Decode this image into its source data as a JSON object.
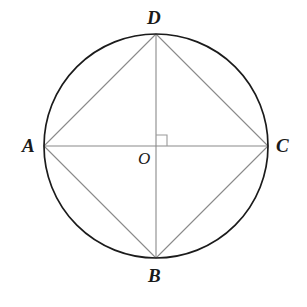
{
  "figure": {
    "background_color": "#ffffff",
    "circle": {
      "name": "circumscribed-circle",
      "center_x": 156,
      "center_y": 146,
      "radius": 112,
      "stroke_color": "#1b1b1b",
      "stroke_width": 1.7
    },
    "center_point": {
      "name": "center-O",
      "label": "O",
      "x": 156,
      "y": 146
    },
    "points": [
      {
        "key": "A",
        "label": "A",
        "x": 44,
        "y": 146,
        "position": "left"
      },
      {
        "key": "B",
        "label": "B",
        "x": 156,
        "y": 258,
        "position": "bottom"
      },
      {
        "key": "C",
        "label": "C",
        "x": 268,
        "y": 146,
        "position": "right"
      },
      {
        "key": "D",
        "label": "D",
        "x": 156,
        "y": 34,
        "position": "top"
      }
    ],
    "segments": [
      {
        "name": "diameter-AC",
        "from": "A",
        "to": "C",
        "type": "diameter"
      },
      {
        "name": "diameter-DB",
        "from": "D",
        "to": "B",
        "type": "diameter"
      },
      {
        "name": "chord-AD",
        "from": "A",
        "to": "D",
        "type": "chord"
      },
      {
        "name": "chord-DC",
        "from": "D",
        "to": "C",
        "type": "chord"
      },
      {
        "name": "chord-CB",
        "from": "C",
        "to": "B",
        "type": "chord"
      },
      {
        "name": "chord-BA",
        "from": "B",
        "to": "A",
        "type": "chord"
      }
    ],
    "segment_stroke_color": "#8a8a8a",
    "segment_stroke_width": 1.1,
    "right_angle_marker": {
      "name": "right-angle-marker-at-O",
      "x": 156,
      "y": 146,
      "size": 11,
      "quadrant": "upper-right",
      "stroke_color": "#9a9a9a",
      "stroke_width": 1.1
    },
    "label_color": "#1a1a1a"
  }
}
